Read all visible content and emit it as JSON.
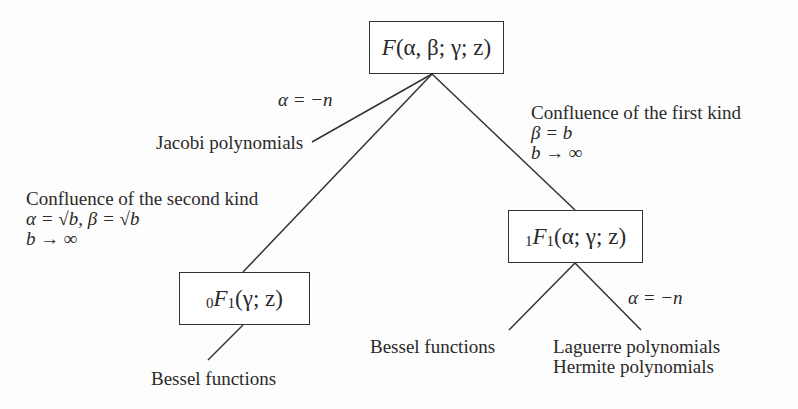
{
  "diagram": {
    "nodes": {
      "root": {
        "prefix": "",
        "func": "F",
        "sub": "",
        "args": "(α, β; γ; z)"
      },
      "kummer": {
        "prefix": "1",
        "func": "F",
        "sub": "1",
        "args": "(α; γ; z)"
      },
      "confluent0": {
        "prefix": "0",
        "func": "F",
        "sub": "1",
        "args": "(γ; z)"
      }
    },
    "edges": {
      "root_to_jacobi": {
        "condition": "α = −n",
        "target": "Jacobi polynomials"
      },
      "root_to_kummer": {
        "title": "Confluence of the first kind",
        "line2": "β = b",
        "line3": "b → ∞"
      },
      "root_to_confluent0": {
        "title": "Confluence of the second kind",
        "line2": "α = √b, β = √b",
        "line3": "b → ∞"
      },
      "kummer_to_bessel": {
        "target": "Bessel functions"
      },
      "kummer_to_laguerre": {
        "condition": "α = −n",
        "target1": "Laguerre polynomials",
        "target2": "Hermite polynomials"
      },
      "confluent0_to_bessel": {
        "target": "Bessel functions"
      }
    }
  }
}
